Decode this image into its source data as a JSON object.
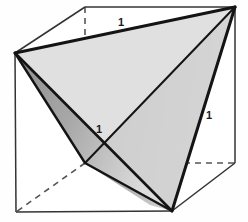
{
  "figure": {
    "shapes": {
      "cube": {
        "name": "cube",
        "style": "wireframe with hidden dashed edges",
        "visible_vertices": {
          "top_front_left": [
            15,
            53
          ],
          "top_back_left": [
            85,
            7
          ],
          "top_back_right": [
            235,
            7
          ],
          "top_front_right": [
            172,
            55
          ],
          "bottom_front_left": [
            16,
            212
          ],
          "bottom_front_right": [
            172,
            211
          ],
          "bottom_back_right": [
            235,
            163
          ]
        },
        "hidden_vertex": {
          "bottom_back_left": [
            85,
            163
          ]
        }
      },
      "tetrahedron": {
        "name": "tetrahedron",
        "vertices": {
          "A_top_front_left": [
            15,
            53
          ],
          "B_top_back_right": [
            235,
            7
          ],
          "C_bottom_front_right": [
            172,
            211
          ],
          "D_bottom_back_left": [
            85,
            163
          ]
        },
        "faces": [
          {
            "id": "top-face",
            "fill": "#e8e8e8"
          },
          {
            "id": "right-face",
            "fill": "#c4c4c4"
          },
          {
            "id": "left-face",
            "fill": "#9a9a9a"
          },
          {
            "id": "lower-front-face",
            "fill": "#d5d5d5"
          }
        ]
      }
    },
    "labels": [
      {
        "id": "top-edge-label",
        "text": "1",
        "x": 118,
        "y": 17,
        "edge": "A-B"
      },
      {
        "id": "right-edge-label",
        "text": "1",
        "x": 206,
        "y": 110,
        "edge": "B-C"
      },
      {
        "id": "center-edge-label",
        "text": "1",
        "x": 96,
        "y": 124,
        "edge": "A-C"
      }
    ],
    "colors": {
      "stroke_solid": "#1a1a1a",
      "stroke_thin": "#4a4a4a",
      "stroke_dashed": "#555555",
      "face_light": "#e8e8e8",
      "face_mid": "#c4c4c4",
      "face_dark": "#9a9a9a",
      "background": "#fefefe"
    }
  }
}
